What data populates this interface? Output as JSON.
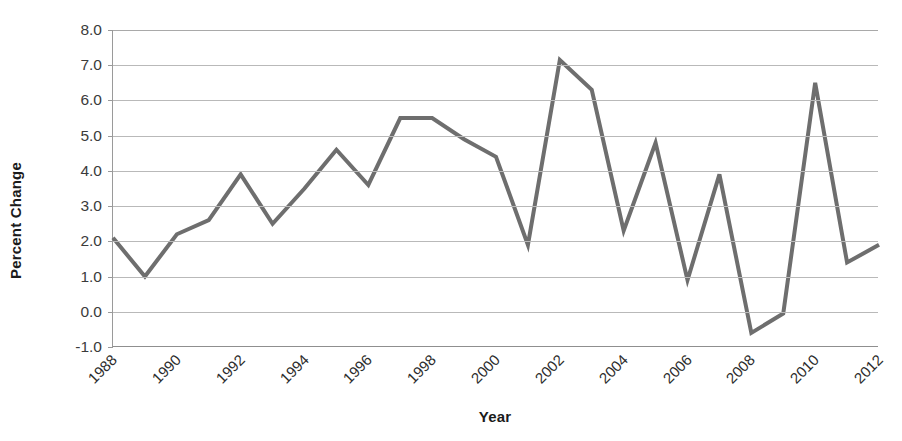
{
  "chart_data": {
    "type": "line",
    "title": "",
    "xlabel": "Year",
    "ylabel": "Percent Change",
    "xlim": [
      1988,
      2012
    ],
    "ylim": [
      -1.0,
      8.0
    ],
    "ytick_step": 1.0,
    "xtick_step": 2,
    "grid": true,
    "legend": "none",
    "line_color": "#6e6e6e",
    "line_width": 4,
    "ytick_labels": [
      "8.0",
      "7.0",
      "6.0",
      "5.0",
      "4.0",
      "3.0",
      "2.0",
      "1.0",
      "0.0",
      "-1.0"
    ],
    "ytick_values": [
      8.0,
      7.0,
      6.0,
      5.0,
      4.0,
      3.0,
      2.0,
      1.0,
      0.0,
      -1.0
    ],
    "xtick_labels": [
      "1988",
      "1990",
      "1992",
      "1994",
      "1996",
      "1998",
      "2000",
      "2002",
      "2004",
      "2006",
      "2008",
      "2010",
      "2012"
    ],
    "xtick_values": [
      1988,
      1990,
      1992,
      1994,
      1996,
      1998,
      2000,
      2002,
      2004,
      2006,
      2008,
      2010,
      2012
    ],
    "x": [
      1988,
      1989,
      1990,
      1991,
      1992,
      1993,
      1994,
      1995,
      1996,
      1997,
      1998,
      1999,
      2000,
      2001,
      2002,
      2003,
      2004,
      2005,
      2006,
      2007,
      2008,
      2009,
      2010,
      2011,
      2012
    ],
    "values": [
      2.1,
      1.0,
      2.2,
      2.6,
      3.9,
      2.5,
      3.5,
      4.6,
      3.6,
      5.5,
      5.5,
      4.9,
      4.4,
      1.9,
      7.15,
      6.3,
      2.3,
      4.8,
      0.9,
      3.9,
      -0.6,
      -0.05,
      6.5,
      1.4,
      1.9
    ],
    "series": [
      {
        "name": "Percent Change",
        "values": [
          2.1,
          1.0,
          2.2,
          2.6,
          3.9,
          2.5,
          3.5,
          4.6,
          3.6,
          5.5,
          5.5,
          4.9,
          4.4,
          1.9,
          7.15,
          6.3,
          2.3,
          4.8,
          0.9,
          3.9,
          -0.6,
          -0.05,
          6.5,
          1.4,
          1.9
        ]
      }
    ]
  },
  "axes": {
    "y_title": "Percent Change",
    "x_title": "Year"
  }
}
